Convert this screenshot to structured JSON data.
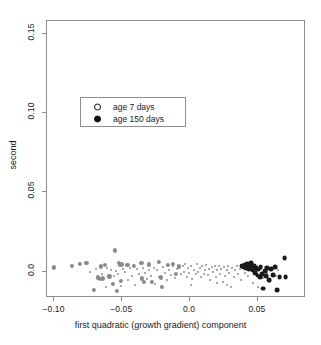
{
  "chart_data": {
    "type": "scatter",
    "title": "",
    "xlabel": "first quadratic (growth gradient) component",
    "ylabel": "second",
    "xlim": [
      -0.1055,
      0.0855
    ],
    "ylim": [
      -0.0165,
      0.158
    ],
    "xticks": [
      -0.1,
      -0.05,
      0.0,
      0.05
    ],
    "xticklabels": [
      "-0.10",
      "-0.05",
      "0.0",
      "0.05"
    ],
    "yticks": [
      0.0,
      0.05,
      0.1,
      0.15
    ],
    "yticklabels": [
      "0.0",
      "0.05",
      "0.10",
      "0.15"
    ],
    "grid": false,
    "legend_position": "upper-left-inside",
    "legend": [
      {
        "label": "age 7 days",
        "marker": "open-circle",
        "color": "#111111"
      },
      {
        "label": "age 150 days",
        "marker": "filled-circle",
        "color": "#111111"
      }
    ],
    "series": [
      {
        "name": "age 7 days",
        "marker": "open-circle",
        "color": "#8a8a8a",
        "size": 4.2,
        "points": [
          [
            -0.0995,
            0.0022
          ],
          [
            -0.0862,
            0.003
          ],
          [
            -0.0802,
            0.0042
          ],
          [
            -0.0757,
            0.0048
          ],
          [
            -0.07,
            -0.0122
          ],
          [
            -0.0672,
            -0.0042
          ],
          [
            -0.066,
            -0.0052
          ],
          [
            -0.0652,
            0.0028
          ],
          [
            -0.0638,
            -0.0048
          ],
          [
            -0.0622,
            0.0036
          ],
          [
            -0.0588,
            -0.0035
          ],
          [
            -0.056,
            -0.008
          ],
          [
            -0.0545,
            0.0128
          ],
          [
            -0.0532,
            -0.0128
          ],
          [
            -0.0518,
            0.0048
          ],
          [
            -0.051,
            0.0035
          ],
          [
            -0.0505,
            -0.0062
          ],
          [
            -0.0498,
            0.004
          ],
          [
            -0.0455,
            0.0036
          ],
          [
            -0.0405,
            0.003
          ],
          [
            -0.0352,
            0.0052
          ],
          [
            -0.0348,
            -0.0048
          ],
          [
            -0.033,
            -0.0068
          ],
          [
            -0.0298,
            0.004
          ],
          [
            -0.0272,
            -0.0072
          ],
          [
            -0.0222,
            0.0058
          ],
          [
            -0.0205,
            -0.0042
          ],
          [
            -0.0198,
            -0.0102
          ],
          [
            -0.0155,
            0.0038
          ],
          [
            -0.0122,
            0.0042
          ],
          [
            -0.0098,
            -0.0022
          ],
          [
            -0.0072,
            0.0028
          ]
        ]
      },
      {
        "name": "small-points",
        "marker": "dot",
        "color": "#7a7a7a",
        "size": 2.0,
        "points": [
          [
            -0.073,
            -0.001
          ],
          [
            -0.0688,
            0.0012
          ],
          [
            -0.064,
            -0.0018
          ],
          [
            -0.0615,
            -0.0105
          ],
          [
            -0.0602,
            0.0018
          ],
          [
            -0.0578,
            0.0008
          ],
          [
            -0.0555,
            -0.003
          ],
          [
            -0.054,
            0.0
          ],
          [
            -0.0522,
            -0.002
          ],
          [
            -0.05,
            -0.0098
          ],
          [
            -0.0488,
            0.001
          ],
          [
            -0.047,
            -0.0008
          ],
          [
            -0.0452,
            -0.006
          ],
          [
            -0.0438,
            0.0018
          ],
          [
            -0.042,
            -0.003
          ],
          [
            -0.04,
            -0.009
          ],
          [
            -0.0385,
            0.001
          ],
          [
            -0.0368,
            -0.0022
          ],
          [
            -0.0342,
            0.002
          ],
          [
            -0.0325,
            -0.0012
          ],
          [
            -0.031,
            -0.0052
          ],
          [
            -0.0292,
            0.0008
          ],
          [
            -0.0278,
            -0.003
          ],
          [
            -0.0262,
            0.0018
          ],
          [
            -0.0248,
            -0.008
          ],
          [
            -0.0235,
            0.0002
          ],
          [
            -0.0218,
            -0.0038
          ],
          [
            -0.019,
            0.0022
          ],
          [
            -0.0175,
            -0.0012
          ],
          [
            -0.0162,
            -0.006
          ],
          [
            -0.0145,
            0.0008
          ],
          [
            -0.0132,
            -0.0028
          ],
          [
            -0.0118,
            0.003
          ],
          [
            -0.0105,
            -0.0048
          ],
          [
            -0.0088,
            0.0012
          ],
          [
            -0.0062,
            -0.0018
          ],
          [
            -0.0048,
            0.003
          ],
          [
            -0.0038,
            -0.0008
          ],
          [
            -0.0028,
            0.004
          ],
          [
            -0.0018,
            -0.0038
          ],
          [
            -0.0008,
            0.0018
          ],
          [
            0.0002,
            -0.0012
          ],
          [
            0.0012,
            0.0032
          ],
          [
            0.0022,
            -0.0052
          ],
          [
            0.0035,
            0.0008
          ],
          [
            0.0048,
            -0.0022
          ],
          [
            0.0058,
            0.0042
          ],
          [
            0.0068,
            -0.0008
          ],
          [
            0.0078,
            0.0018
          ],
          [
            0.0088,
            -0.0038
          ],
          [
            0.0098,
            0.0028
          ],
          [
            0.0108,
            -0.0018
          ],
          [
            0.0118,
            0.0008
          ],
          [
            0.0128,
            0.0038
          ],
          [
            0.0138,
            -0.0028
          ],
          [
            0.0148,
            0.0012
          ],
          [
            0.0158,
            -0.0058
          ],
          [
            0.0168,
            0.0022
          ],
          [
            0.0178,
            -0.0008
          ],
          [
            0.0188,
            0.0032
          ],
          [
            0.0198,
            -0.0042
          ],
          [
            0.0208,
            0.0008
          ],
          [
            0.0218,
            0.0028
          ],
          [
            0.0228,
            -0.0018
          ],
          [
            0.0238,
            0.0012
          ],
          [
            0.0248,
            -0.0068
          ],
          [
            0.0258,
            0.0022
          ],
          [
            0.0268,
            -0.003
          ],
          [
            0.0278,
            0.0008
          ],
          [
            0.0288,
            0.0032
          ],
          [
            0.0298,
            -0.0012
          ],
          [
            0.0308,
            -0.0102
          ],
          [
            0.0318,
            0.0018
          ],
          [
            0.0328,
            -0.0042
          ],
          [
            0.0338,
            0.0008
          ],
          [
            0.0352,
            0.0028
          ],
          [
            0.0362,
            -0.0022
          ],
          [
            0.0372,
            0.0012
          ],
          [
            0.0385,
            -0.0058
          ],
          [
            0.0398,
            0.0018
          ],
          [
            0.0412,
            -0.0012
          ],
          [
            0.0425,
            0.0032
          ],
          [
            0.0438,
            -0.0032
          ],
          [
            0.0452,
            0.0008
          ],
          [
            0.0468,
            -0.0078
          ],
          [
            0.0482,
            0.0018
          ],
          [
            0.0498,
            -0.0018
          ],
          [
            0.0512,
            -0.0102
          ],
          [
            0.0528,
            0.0012
          ],
          [
            0.0545,
            -0.0048
          ],
          [
            0.0562,
            0.0022
          ],
          [
            0.0578,
            -0.0012
          ],
          [
            0.0598,
            -0.007
          ],
          [
            0.0618,
            0.0018
          ],
          [
            0.0638,
            -0.003
          ],
          [
            0.0655,
            0.0008
          ],
          [
            0.0012,
            -0.0088
          ],
          [
            0.0205,
            -0.0075
          ],
          [
            0.0282,
            -0.009
          ]
        ]
      },
      {
        "name": "age 150 days",
        "marker": "filled-circle",
        "color": "#1a1a1a",
        "size": 4.8,
        "points": [
          [
            0.0392,
            0.003
          ],
          [
            0.0402,
            0.0022
          ],
          [
            0.0412,
            0.0034
          ],
          [
            0.042,
            0.0018
          ],
          [
            0.0428,
            0.004
          ],
          [
            0.0435,
            0.0026
          ],
          [
            0.0442,
            0.0012
          ],
          [
            0.0448,
            0.0034
          ],
          [
            0.0458,
            0.0048
          ],
          [
            0.0465,
            0.002
          ],
          [
            0.0472,
            0.0002
          ],
          [
            0.048,
            0.003
          ],
          [
            0.0488,
            -0.0012
          ],
          [
            0.0498,
            0.0018
          ],
          [
            0.0505,
            -0.003
          ],
          [
            0.0512,
            0.0008
          ],
          [
            0.0522,
            -0.0038
          ],
          [
            0.0528,
            0.0024
          ],
          [
            0.0538,
            -0.0022
          ],
          [
            0.0548,
            -0.0112
          ],
          [
            0.0558,
            0.0
          ],
          [
            0.0568,
            -0.0032
          ],
          [
            0.0578,
            0.0018
          ],
          [
            0.0592,
            -0.0058
          ],
          [
            0.0605,
            0.0012
          ],
          [
            0.0618,
            -0.0028
          ],
          [
            0.0632,
            0.0022
          ],
          [
            0.0648,
            -0.012
          ],
          [
            0.0668,
            -0.0038
          ],
          [
            0.0705,
            0.0078
          ],
          [
            0.0712,
            -0.004
          ]
        ]
      }
    ]
  },
  "axes": {
    "frame": {
      "left": 46,
      "top": 20,
      "width": 259,
      "height": 277
    }
  }
}
